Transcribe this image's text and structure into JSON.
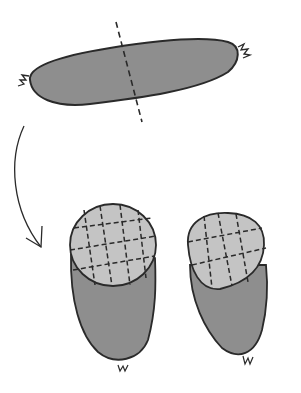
{
  "diagram": {
    "colors": {
      "casing": "#8e8e8e",
      "cut_face": "#c4c4c4",
      "outline": "#2a2a2a",
      "background": "#ffffff"
    },
    "elements": [
      {
        "id": "whole-sausage",
        "label": "whole sausage with cut line"
      },
      {
        "id": "arrow",
        "label": "curved arrow down"
      },
      {
        "id": "left-half",
        "label": "sausage half with scored face"
      },
      {
        "id": "right-half",
        "label": "sausage half with scored face"
      }
    ]
  }
}
